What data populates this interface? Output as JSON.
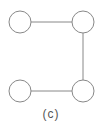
{
  "diagram": {
    "caption": "(c)",
    "stroke_color": "#888888",
    "nodes": [
      {
        "id": "top-left",
        "cx": 20,
        "cy": 22,
        "r": 11
      },
      {
        "id": "top-right",
        "cx": 83,
        "cy": 22,
        "r": 11
      },
      {
        "id": "bottom-left",
        "cx": 20,
        "cy": 91,
        "r": 11
      },
      {
        "id": "bottom-right",
        "cx": 83,
        "cy": 91,
        "r": 11
      }
    ],
    "edges": [
      {
        "from": "top-left",
        "to": "top-right"
      },
      {
        "from": "top-right",
        "to": "bottom-right"
      },
      {
        "from": "bottom-left",
        "to": "bottom-right"
      }
    ]
  }
}
